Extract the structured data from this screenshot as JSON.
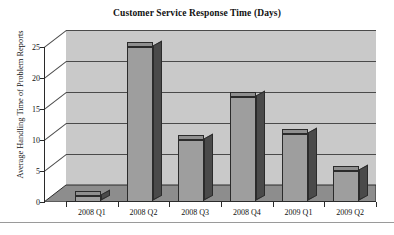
{
  "chart_data": {
    "type": "bar",
    "title": "Customer Service Response Time (Days)",
    "xlabel": "",
    "ylabel": "Average Handling Time of Problem Reports",
    "categories": [
      "2008 Q1",
      "2008 Q2",
      "2008 Q3",
      "2008 Q4",
      "2009 Q1",
      "2009 Q2"
    ],
    "values": [
      1,
      25,
      10,
      17,
      11,
      5
    ],
    "ylim": [
      0,
      25
    ],
    "yticks": [
      0,
      5,
      10,
      15,
      20,
      25
    ],
    "ytick_labels": [
      "0",
      "5",
      "10",
      "15",
      "20",
      "25"
    ],
    "grid": true,
    "legend": false,
    "style": "3d-column",
    "colors": {
      "bar_front": "#9e9e9e",
      "bar_side": "#4a4a4a",
      "bar_top": "#8f8f8f",
      "wall": "#c9c9c9",
      "floor": "#8d8d8d",
      "axis": "#2a2a2a",
      "gridline": "#4a4a4a",
      "text": "#111111",
      "background": "#ffffff"
    }
  }
}
